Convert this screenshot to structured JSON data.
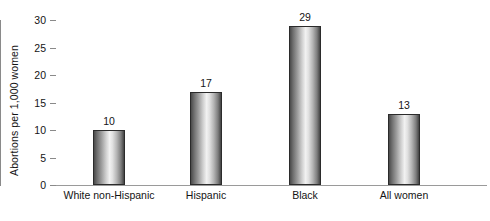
{
  "chart_data": {
    "type": "bar",
    "title": "",
    "subtitle": "",
    "xlabel": "",
    "ylabel": "Abortions per 1,000 women",
    "categories": [
      "White non-Hispanic",
      "Hispanic",
      "Black",
      "All women"
    ],
    "values": [
      10,
      17,
      29,
      13
    ],
    "value_labels": [
      "10",
      "17",
      "29",
      "13"
    ],
    "ylim": [
      0,
      30
    ],
    "y_ticks": [
      0,
      5,
      10,
      15,
      20,
      25,
      30
    ],
    "y_tick_labels": [
      "0",
      "5",
      "10",
      "15",
      "20",
      "25",
      "30"
    ],
    "grid": false,
    "legend": null,
    "legend_position": "none",
    "annotations": [],
    "series": [
      {
        "name": "Abortions per 1,000 women",
        "values": [
          10,
          17,
          29,
          13
        ]
      }
    ],
    "colors": {
      "background": "#ffffff",
      "bar_edge": "#2b2b2b",
      "bar_gradient_dark": "#434343",
      "bar_gradient_light": "#f2f2f2",
      "axis": "#8a8a8a",
      "text": "#141414"
    }
  }
}
